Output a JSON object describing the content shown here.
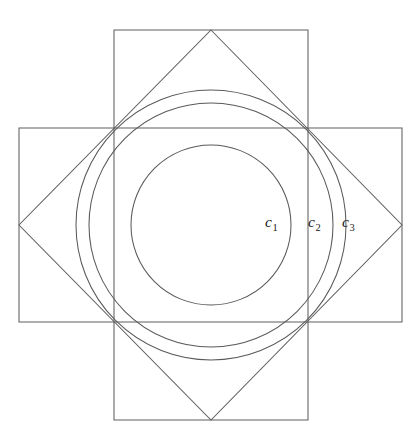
{
  "figure": {
    "background_color": "#ffffff",
    "stroke_color": "#5f5f5f",
    "label_color": "#1a1a1a",
    "center": {
      "x": 211,
      "y": 225
    },
    "shapes": {
      "vertical_rectangle": {
        "name": "vertical-rectangle",
        "x": 114,
        "y": 30,
        "width": 194,
        "height": 390
      },
      "horizontal_rectangle": {
        "name": "horizontal-rectangle",
        "x": 19,
        "y": 128,
        "width": 383,
        "height": 194
      },
      "diamond": {
        "name": "diamond",
        "points": "211,30 402,225 211,420 19,225"
      },
      "circles": [
        {
          "name": "circle-c1",
          "cx": 211,
          "cy": 225,
          "r": 80
        },
        {
          "name": "circle-c2",
          "cx": 211,
          "cy": 225,
          "r": 122
        },
        {
          "name": "circle-c3",
          "cx": 211,
          "cy": 225,
          "r": 135
        }
      ]
    },
    "labels": [
      {
        "id": "c1",
        "base": "c",
        "subscript": "1",
        "x": 265,
        "y": 214
      },
      {
        "id": "c2",
        "base": "c",
        "subscript": "2",
        "x": 308,
        "y": 214
      },
      {
        "id": "c3",
        "base": "c",
        "subscript": "3",
        "x": 342,
        "y": 214
      }
    ]
  }
}
